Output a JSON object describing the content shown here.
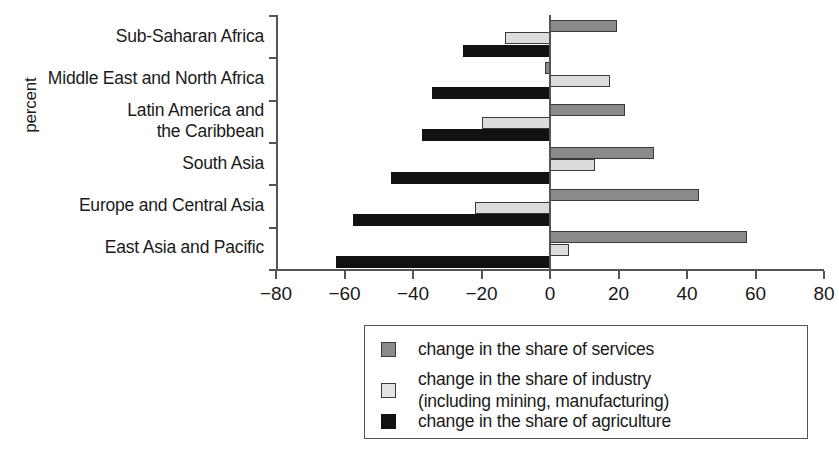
{
  "chart_data": {
    "type": "bar",
    "orientation": "horizontal",
    "title": "",
    "xlabel": "",
    "ylabel": "percent",
    "xlim": [
      -80,
      80
    ],
    "xticks": [
      -80,
      -60,
      -40,
      -20,
      0,
      20,
      40,
      60,
      80
    ],
    "xticklabels": [
      "−80",
      "−60",
      "−40",
      "−20",
      "0",
      "20",
      "40",
      "60",
      "80"
    ],
    "grid": false,
    "legend_position": "bottom-right",
    "categories": [
      "Sub-Saharan Africa",
      "Middle East and North Africa",
      "Latin America and\nthe Caribbean",
      "South Asia",
      "Europe and Central Asia",
      "East Asia and Pacific"
    ],
    "series": [
      {
        "name": "change in the share of services",
        "color": "#8a8a8a",
        "values": [
          19.5,
          -1.5,
          22.0,
          30.5,
          43.5,
          57.5
        ]
      },
      {
        "name": "change in the share of industry\n(including mining, manufacturing)",
        "color": "#dcdcdc",
        "values": [
          -13.0,
          17.5,
          -20.0,
          13.0,
          -22.0,
          5.5
        ]
      },
      {
        "name": "change in the share of agriculture",
        "color": "#111111",
        "values": [
          -25.5,
          -34.5,
          -37.5,
          -46.5,
          -57.5,
          -62.5
        ]
      }
    ]
  },
  "legend": {
    "items": [
      {
        "label": "change in the share of services",
        "swatch": "services"
      },
      {
        "label": "change in the share of industry\n(including mining, manufacturing)",
        "swatch": "industry"
      },
      {
        "label": "change in the share of agriculture",
        "swatch": "agriculture"
      }
    ]
  },
  "axis": {
    "y_title": "percent"
  }
}
